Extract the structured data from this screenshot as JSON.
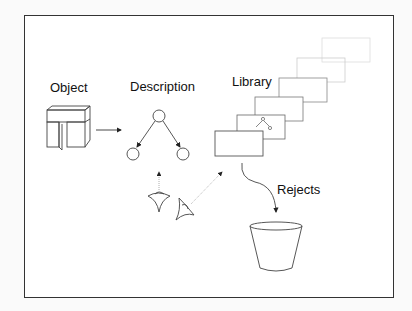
{
  "diagram": {
    "labels": {
      "object": "Object",
      "description": "Description",
      "library": "Library",
      "rejects": "Rejects"
    },
    "nodes": [
      {
        "id": "object",
        "icon": "object-block-icon"
      },
      {
        "id": "description",
        "icon": "tree-graph-icon"
      },
      {
        "id": "library",
        "icon": "stacked-cards-icon"
      },
      {
        "id": "viewers",
        "icon": "eye-viewpoint-icon"
      },
      {
        "id": "rejects",
        "icon": "bucket-icon"
      }
    ],
    "edges": [
      {
        "from": "object",
        "to": "description"
      },
      {
        "from": "viewers",
        "to": "description"
      },
      {
        "from": "viewers",
        "to": "library"
      },
      {
        "from": "library",
        "to": "rejects"
      }
    ],
    "colors": {
      "stroke": "#333333",
      "faint": "#c8c8c8"
    }
  }
}
